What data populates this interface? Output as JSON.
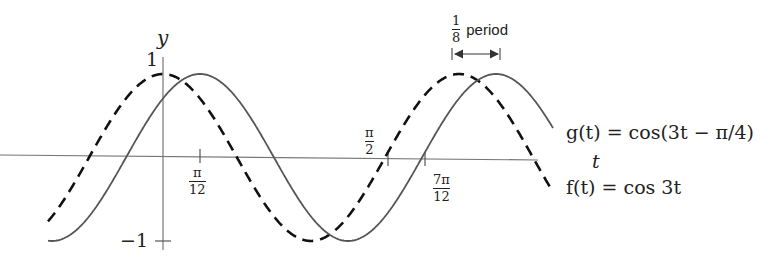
{
  "chart_data": {
    "type": "line",
    "title": "",
    "xlabel": "t",
    "ylabel": "y",
    "ylim": [
      -1,
      1
    ],
    "y_ticks": [
      "1",
      "-1"
    ],
    "x_tick_labels": [
      "π/12",
      "π/2",
      "7π/12"
    ],
    "x_tick_values": [
      0.2618,
      1.5708,
      1.8326
    ],
    "series": [
      {
        "name": "f(t) = cos 3t",
        "style": "dashed",
        "formula": "cos(3t)",
        "x_range": [
          -0.257,
          0.872
        ],
        "peak_t": [
          0,
          2.0944
        ]
      },
      {
        "name": "g(t) = cos(3t − π/4)",
        "style": "solid",
        "formula": "cos(3t - pi/4)",
        "x_range": [
          -0.257,
          0.872
        ],
        "peak_t": [
          0.2618,
          2.3562
        ]
      }
    ],
    "annotations": [
      {
        "text": "1/8 period",
        "type": "double-arrow",
        "meaning": "horizontal shift between f and g peaks"
      }
    ],
    "grid": false,
    "legend": "inline labels at right"
  },
  "labels": {
    "y_axis": "y",
    "t_axis": "t",
    "y_one": "1",
    "y_minus_one": "−1",
    "tick_pi12_num": "π",
    "tick_pi12_den": "12",
    "tick_pi2_num": "π",
    "tick_pi2_den": "2",
    "tick_7pi12_num": "7π",
    "tick_7pi12_den": "12",
    "g_label": "g(t) = cos(3t − π/4)",
    "f_label": "f(t) = cos 3t",
    "period_num": "1",
    "period_den": "8",
    "period_word": "period"
  }
}
